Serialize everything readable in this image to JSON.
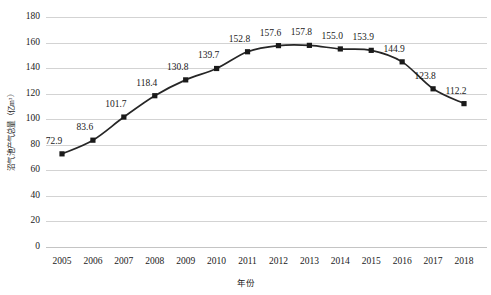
{
  "chart_data": {
    "type": "line",
    "title": "",
    "xlabel": "年份",
    "ylabel": "沼气池产气总量（亿m³）",
    "categories": [
      "2005",
      "2006",
      "2007",
      "2008",
      "2009",
      "2010",
      "2011",
      "2012",
      "2013",
      "2014",
      "2015",
      "2016",
      "2017",
      "2018"
    ],
    "values": [
      72.9,
      83.6,
      101.7,
      118.4,
      130.8,
      139.7,
      152.8,
      157.6,
      157.8,
      155.0,
      153.9,
      144.9,
      123.8,
      112.2
    ],
    "point_labels": [
      "72.9",
      "83.6",
      "101.7",
      "118.4",
      "130.8",
      "139.7",
      "152.8",
      "157.6",
      "157.8",
      "155.0",
      "153.9",
      "144.9",
      "123.8",
      "112.2"
    ],
    "ylim": [
      0,
      180
    ],
    "ytick_values": [
      0,
      20,
      40,
      60,
      80,
      100,
      120,
      140,
      160,
      180
    ],
    "ytick_labels": [
      "0",
      "20",
      "40",
      "60",
      "80",
      "100",
      "120",
      "140",
      "160",
      "180"
    ],
    "grid": true,
    "grid_axis": "y",
    "legend": false,
    "legend_position": "none",
    "series_name": "沼气池产气总量",
    "marker": "square",
    "line_color": "#262626",
    "marker_color": "#1a1a1a",
    "grid_color": "#d3d3d3",
    "background_color": "#ffffff",
    "text_color": "#1a1a1a"
  }
}
